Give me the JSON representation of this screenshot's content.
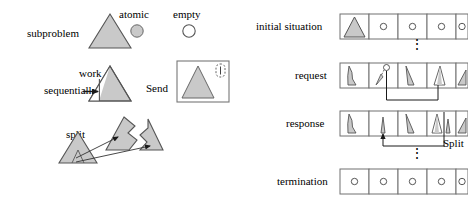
{
  "figure": {
    "title": "",
    "legend": {
      "subproblem_label": "subproblem",
      "atomic_label": "atomic",
      "empty_label": "empty"
    },
    "operations": {
      "work_sequentially_label_line1": "work",
      "work_sequentially_label_line2": "sequentially",
      "send_label": "Send",
      "send_box_text": "Proc. 1022",
      "split_label": "split"
    },
    "timeline": {
      "rows": [
        {
          "label": "initial situation",
          "cells": [
            {
              "kind": "full-triangle"
            },
            {
              "kind": "empty-circle"
            },
            {
              "kind": "empty-circle"
            },
            {
              "kind": "empty-circle"
            },
            {
              "kind": "empty-circle"
            }
          ]
        },
        {
          "label": "request",
          "cells": [
            {
              "kind": "partial-triangle-a"
            },
            {
              "kind": "partial-triangle-b"
            },
            {
              "kind": "partial-triangle-c"
            },
            {
              "kind": "partial-triangle-d"
            },
            {
              "kind": "partial-triangle-e"
            }
          ]
        },
        {
          "label": "response",
          "cells": [
            {
              "kind": "partial-triangle-a"
            },
            {
              "kind": "sliver-triangle"
            },
            {
              "kind": "partial-triangle-c"
            },
            {
              "kind": "partial-triangle-d"
            },
            {
              "kind": "partial-triangle-e"
            }
          ]
        },
        {
          "label": "termination",
          "cells": [
            {
              "kind": "empty-circle"
            },
            {
              "kind": "empty-circle"
            },
            {
              "kind": "empty-circle"
            },
            {
              "kind": "empty-circle"
            },
            {
              "kind": "empty-circle"
            }
          ]
        }
      ],
      "split_annotation": "Split",
      "ellipsis": "⋮"
    },
    "colors": {
      "fill_gray": "#c9c9c9",
      "stroke": "#3d3d3d",
      "cell_stroke": "#707070",
      "text": "#000000",
      "white": "#ffffff"
    }
  }
}
